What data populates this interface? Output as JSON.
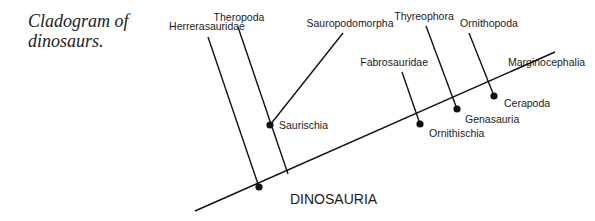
{
  "caption": {
    "line1": "Cladogram of",
    "line2": "dinosaurs."
  },
  "root": {
    "label": "DINOSAURIA",
    "node": [
      259,
      187
    ]
  },
  "axis": {
    "from": [
      195,
      211
    ],
    "to": [
      555,
      52
    ],
    "color": "#111111"
  },
  "taxa": [
    {
      "name": "Herrerasauridae",
      "label_xy": [
        207,
        30
      ],
      "tip": [
        208,
        37
      ],
      "base": [
        259,
        187
      ]
    },
    {
      "name": "Theropoda",
      "label_xy": [
        239,
        21
      ],
      "tip": [
        238,
        27
      ],
      "base": [
        288,
        174
      ]
    },
    {
      "name": "Sauropodomorpha",
      "label_xy": [
        350,
        27
      ],
      "tip": [
        343,
        33
      ],
      "base": [
        270,
        125
      ]
    },
    {
      "name": "Fabrosauridae",
      "label_xy": [
        428,
        66
      ],
      "tip": [
        402,
        72
      ],
      "base": [
        420,
        124
      ]
    },
    {
      "name": "Thyreophora",
      "label_xy": [
        424,
        20
      ],
      "tip": [
        426,
        26
      ],
      "base": [
        457,
        109
      ]
    },
    {
      "name": "Ornithopoda",
      "label_xy": [
        489,
        27
      ],
      "tip": [
        469,
        33
      ],
      "base": [
        494,
        96
      ]
    },
    {
      "name": "Marginocephalia",
      "label_xy": [
        548,
        63
      ],
      "tip": [
        555,
        52
      ],
      "base": [
        494,
        96
      ]
    }
  ],
  "clades": [
    {
      "name": "Saurischia",
      "node": [
        270,
        125
      ],
      "label_xy": [
        279,
        129
      ]
    },
    {
      "name": "Ornithischia",
      "node": [
        420,
        124
      ],
      "label_xy": [
        429,
        137
      ]
    },
    {
      "name": "Genasauria",
      "node": [
        457,
        109
      ],
      "label_xy": [
        465,
        121
      ]
    },
    {
      "name": "Cerapoda",
      "node": [
        494,
        96
      ],
      "label_xy": [
        504,
        107
      ]
    }
  ]
}
